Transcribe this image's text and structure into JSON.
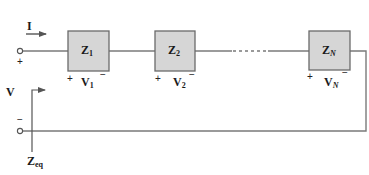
{
  "diagram": {
    "type": "series-circuit",
    "colors": {
      "wire": "#7a7a7a",
      "box_fill": "#d6d6d6",
      "box_border": "#6a6a6a",
      "text": "#1a1a1a"
    },
    "current": {
      "symbol": "I"
    },
    "source_voltage": {
      "symbol": "V",
      "plus": "+",
      "minus": "−"
    },
    "equivalent_impedance": {
      "symbol": "Z",
      "subscript": "eq"
    },
    "elements": [
      {
        "impedance": "Z",
        "index": "1",
        "voltage": "V",
        "voltage_index": "1",
        "plus": "+",
        "minus": "−"
      },
      {
        "impedance": "Z",
        "index": "2",
        "voltage": "V",
        "voltage_index": "2",
        "plus": "+",
        "minus": "−"
      },
      {
        "impedance": "Z",
        "index": "N",
        "voltage": "V",
        "voltage_index": "N",
        "plus": "+",
        "minus": "−"
      }
    ]
  }
}
